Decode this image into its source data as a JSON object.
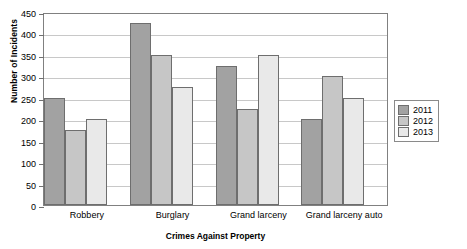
{
  "chart_data": {
    "type": "bar",
    "title": "",
    "xlabel": "Crimes Against Property",
    "ylabel": "Number of Incidents",
    "categories": [
      "Robbery",
      "Burglary",
      "Grand larceny",
      "Grand larceny auto"
    ],
    "series": [
      {
        "name": "2011",
        "color": "#a2a2a2",
        "values": [
          250,
          425,
          325,
          200
        ]
      },
      {
        "name": "2012",
        "color": "#c6c6c6",
        "values": [
          175,
          350,
          225,
          300
        ]
      },
      {
        "name": "2013",
        "color": "#e9e9e9",
        "values": [
          200,
          275,
          350,
          250
        ]
      }
    ],
    "ylim": [
      0,
      450
    ],
    "ytick_step": 50,
    "yticks": [
      0,
      50,
      100,
      150,
      200,
      250,
      300,
      350,
      400,
      450
    ],
    "ytick_labels": [
      "0",
      "50",
      "100",
      "150",
      "200",
      "250",
      "300",
      "350",
      "400",
      "450"
    ],
    "grid": true,
    "legend_position": "right"
  }
}
